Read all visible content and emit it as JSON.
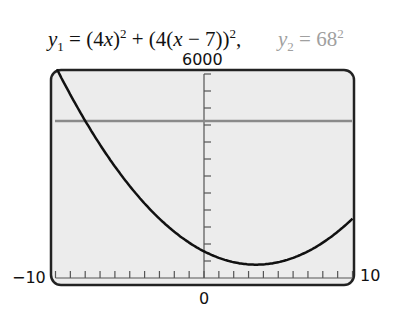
{
  "title": {
    "y1_text": "y1 = (4x)^2 + (4(x − 7))^2,",
    "y2_text": "y2 = 68^2"
  },
  "labels": {
    "ymax": "6000",
    "xmin": "−10",
    "xmax": "10",
    "ymin": "0"
  },
  "colors": {
    "curve": "#111111",
    "line": "#8a8a8a",
    "screen_bg": "#ececec",
    "frame": "#222222"
  },
  "chart_data": {
    "type": "line",
    "xlabel": "",
    "ylabel": "",
    "xlim": [
      -10,
      10
    ],
    "ylim": [
      0,
      6000
    ],
    "x_tick_step": 1,
    "y_tick_step": 500,
    "grid": false,
    "legend": "none",
    "series": [
      {
        "name": "y1 = (4x)^2 + (4(x-7))^2",
        "x": [
          -10,
          -8,
          -6,
          -4,
          -2,
          0,
          2,
          3.5,
          5,
          7,
          9,
          10
        ],
        "values": [
          6224,
          4624,
          3280,
          2192,
          1360,
          784,
          464,
          392,
          464,
          784,
          1360,
          1744
        ]
      },
      {
        "name": "y2 = 68^2",
        "x": [
          -10,
          10
        ],
        "values": [
          4624,
          4624
        ]
      }
    ],
    "tick_labels": {
      "x": [
        "-10",
        "0",
        "10"
      ],
      "y": [
        "6000"
      ]
    }
  }
}
